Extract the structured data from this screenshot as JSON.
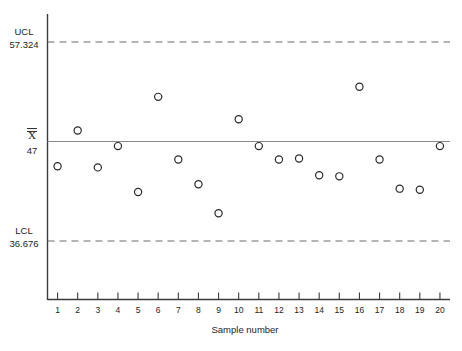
{
  "chart_data": {
    "type": "scatter",
    "title": "",
    "xlabel": "Sample number",
    "ylabel": "",
    "grid": false,
    "legend": "none",
    "x": [
      1,
      2,
      3,
      4,
      5,
      6,
      7,
      8,
      9,
      10,
      11,
      12,
      13,
      14,
      15,
      16,
      17,
      18,
      19,
      20
    ],
    "categories": [
      "1",
      "2",
      "3",
      "4",
      "5",
      "6",
      "7",
      "8",
      "9",
      "10",
      "11",
      "12",
      "13",
      "14",
      "15",
      "16",
      "17",
      "18",
      "19",
      "20"
    ],
    "values": [
      46.4,
      49.6,
      46.3,
      48.2,
      44.1,
      52.6,
      47.0,
      44.8,
      42.2,
      50.6,
      48.2,
      47.0,
      47.1,
      45.6,
      45.5,
      53.5,
      47.0,
      44.4,
      44.3,
      48.2
    ],
    "ylim": [
      34.5,
      60.0
    ],
    "xlim": [
      0.5,
      20.5
    ],
    "upper_control_limit": 57.324,
    "center_line": 47,
    "lower_control_limit": 36.676,
    "annotations": {
      "ucl_label": "UCL",
      "ucl_value": "57.324",
      "center_symbol": "X",
      "center_value": "47",
      "lcl_label": "LCL",
      "lcl_value": "36.676"
    },
    "colors": {
      "point_stroke": "#2a2a2a",
      "point_fill": "#ffffff",
      "center_line": "#8a8a8a",
      "limit_line": "#6d6d6d",
      "axis": "#3b3b3b",
      "background": "#ffffff"
    }
  }
}
